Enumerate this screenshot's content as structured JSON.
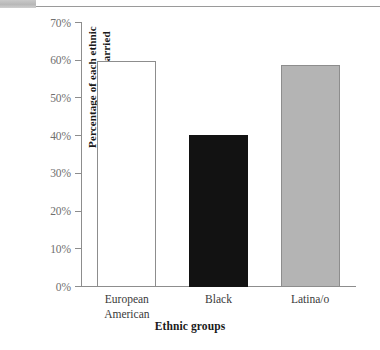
{
  "chrome": {
    "tab_block": "",
    "rule": ""
  },
  "chart_data": {
    "type": "bar",
    "title": "",
    "xlabel": "Ethnic groups",
    "ylabel_lines": [
      "Percentage of each ethnic",
      "group who are married"
    ],
    "ylabel": "Percentage of each ethnic group who are married",
    "categories": [
      "European American",
      "Black",
      "Latina/o"
    ],
    "category_label_lines": [
      [
        "European",
        "American"
      ],
      [
        "Black",
        ""
      ],
      [
        "Latina/o",
        ""
      ]
    ],
    "values": [
      60,
      40.3,
      59
    ],
    "value_labels": [
      "60%",
      "40%",
      "59%"
    ],
    "ylim": [
      0,
      70
    ],
    "ytick_values": [
      70,
      60,
      50,
      40,
      30,
      20,
      10,
      0
    ],
    "ytick_labels": [
      "70%",
      "60%",
      "50%",
      "40%",
      "30%",
      "20%",
      "10%",
      "0%"
    ],
    "grid": false,
    "legend": "none",
    "bar_styles": [
      "style-outline",
      "style-dark",
      "style-gray"
    ],
    "colors": {
      "bar_outline_fill": "#ffffff",
      "bar_dark_fill": "#121212",
      "bar_gray_fill": "#b4b4b4",
      "axis": "#8d8d8d",
      "tick_text": "#6f6f6f",
      "title_text": "#1a1a1a"
    }
  }
}
